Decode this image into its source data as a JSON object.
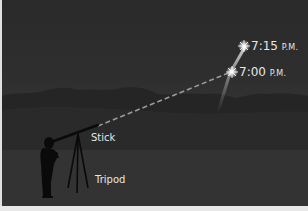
{
  "diagram": {
    "labels": {
      "time_late": {
        "time": "7:15",
        "suffix": "P.M."
      },
      "time_early": {
        "time": "7:00",
        "suffix": "P.M."
      },
      "stick": "Stick",
      "tripod": "Tripod"
    },
    "elements": [
      "star-at-7-15",
      "star-at-7-00",
      "star-trail",
      "sight-line-dashed",
      "mountain-horizon",
      "person-silhouette",
      "stick-on-tripod"
    ],
    "colors": {
      "sky_top": "#2a2a2a",
      "sky_bottom": "#444444",
      "mountains": "#252525",
      "silhouette": "#0a0a0a",
      "text": "#e6e6e6",
      "sight_line": "#9a9a9a",
      "star": "#ffffff"
    }
  }
}
